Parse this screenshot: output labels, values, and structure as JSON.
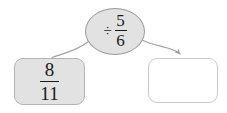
{
  "diagram": {
    "type": "fraction-operation-flow",
    "title": "",
    "background_color": "#ffffff"
  },
  "operator_node": {
    "name": "division-operator",
    "symbol": "÷",
    "symbol_name": "division-sign",
    "operand": {
      "numerator": "5",
      "denominator": "6"
    },
    "shape": "ellipse",
    "fill_color": "#e2e2e2",
    "border_color": "#9a9a9a"
  },
  "source_box": {
    "name": "source-fraction",
    "numerator": "8",
    "denominator": "11",
    "fill_color": "#e2e2e2",
    "border_color": "#b4b4b4"
  },
  "result_box": {
    "name": "answer-box",
    "value": "",
    "placeholder": "",
    "fill_color": "#ffffff",
    "border_color": "#c9c9c9"
  },
  "connectors": [
    {
      "name": "source-connector",
      "from": "operator_node",
      "to": "source_box",
      "arrowhead": false,
      "color": "#9e9e9e"
    },
    {
      "name": "result-connector",
      "from": "operator_node",
      "to": "result_box",
      "arrowhead": true,
      "color": "#9e9e9e"
    }
  ]
}
